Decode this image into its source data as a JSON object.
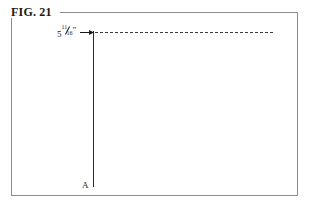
{
  "figure": {
    "caption": "FIG. 21",
    "background_color": "#ffffff",
    "frame_color": "#8c8c8c",
    "line_color": "#2b2b2b"
  },
  "annotations": {
    "dimension": {
      "whole": "5",
      "numerator": "11",
      "denominator": "16",
      "unit": "”",
      "full_text": "5 11/16”",
      "arrow_direction": "right"
    },
    "point_label": "A"
  },
  "geometry": {
    "reference_line_style": "dashed",
    "construction_line_style": "solid"
  }
}
